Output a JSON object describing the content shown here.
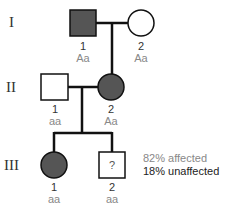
{
  "colors": {
    "affected_fill": "#555555",
    "unaffected_fill": "#ffffff",
    "line": "#111111"
  },
  "generations": [
    {
      "label": "I"
    },
    {
      "label": "II"
    },
    {
      "label": "III"
    }
  ],
  "individuals": {
    "I_1": {
      "number": "1",
      "genotype": "Aa",
      "sex": "male",
      "affected": true
    },
    "I_2": {
      "number": "2",
      "genotype": "Aa",
      "sex": "female",
      "affected": false
    },
    "II_1": {
      "number": "1",
      "genotype": "aa",
      "sex": "male",
      "affected": false
    },
    "II_2": {
      "number": "2",
      "genotype": "Aa",
      "sex": "female",
      "affected": true
    },
    "III_1": {
      "number": "1",
      "genotype": "aa",
      "sex": "female",
      "affected": true
    },
    "III_2": {
      "number": "2",
      "genotype": "aa",
      "sex": "male",
      "affected": "unknown",
      "symbol_text": "?"
    }
  },
  "annotation": {
    "line1": "82% affected",
    "line2": "18% unaffected"
  }
}
